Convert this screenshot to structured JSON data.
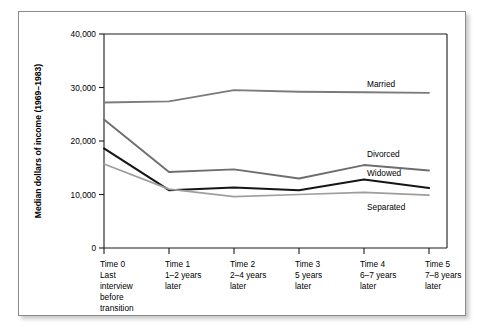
{
  "figure": {
    "frame_border_color": "#8a8a8a",
    "background": "#ffffff"
  },
  "chart_data": {
    "type": "line",
    "title": "",
    "xlabel": "",
    "ylabel": "Median dollars of income (1969–1983)",
    "ylim": [
      0,
      40000
    ],
    "yticks": [
      0,
      10000,
      20000,
      30000,
      40000
    ],
    "ytick_labels": [
      "0",
      "10,000",
      "20,000",
      "30,000",
      "40,000"
    ],
    "grid": false,
    "legend_position": "right-inline-labels",
    "categories": [
      "Time 0",
      "Time 1",
      "Time 2",
      "Time 3",
      "Time 4",
      "Time 5"
    ],
    "xtick_labels": [
      [
        "Time 0",
        "Last",
        "interview",
        "before",
        "transition"
      ],
      [
        "Time 1",
        "1–2 years",
        "later"
      ],
      [
        "Time 2",
        "2–4 years",
        "later"
      ],
      [
        "Time 3",
        "5 years",
        "later"
      ],
      [
        "Time 4",
        "6–7 years",
        "later"
      ],
      [
        "Time 5",
        "7–8 years",
        "later"
      ]
    ],
    "series": [
      {
        "name": "Married",
        "color": "#7b7b7b",
        "width": 1.9,
        "values": [
          27200,
          27400,
          29500,
          29200,
          29100,
          29000
        ],
        "label": "Married",
        "label_value": 30700
      },
      {
        "name": "Divorced",
        "color": "#6e6e6e",
        "width": 1.9,
        "values": [
          24000,
          14200,
          14700,
          13000,
          15500,
          14500
        ],
        "label": "Divorced",
        "label_value": 17600
      },
      {
        "name": "Widowed",
        "color": "#161616",
        "width": 2.1,
        "values": [
          18600,
          10800,
          11300,
          10800,
          12800,
          11200
        ],
        "label": "Widowed",
        "label_value": 14100
      },
      {
        "name": "Separated",
        "color": "#9e9e9e",
        "width": 1.7,
        "values": [
          15700,
          11000,
          9600,
          10000,
          10400,
          9900
        ],
        "label": "Separated",
        "label_value": 7600
      }
    ]
  }
}
